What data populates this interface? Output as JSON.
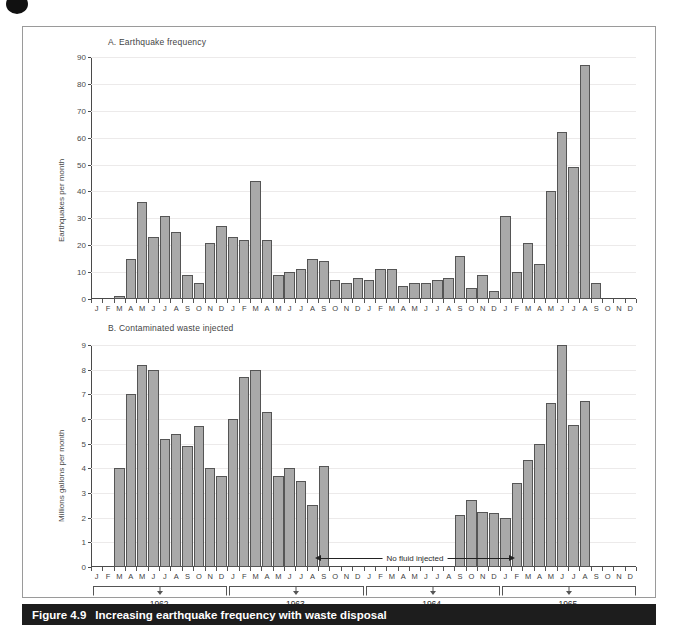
{
  "figure": {
    "caption_number": "Figure 4.9",
    "caption_text": "Increasing earthquake frequency with waste disposal"
  },
  "panel_a": {
    "title": "A. Earthquake frequency"
  },
  "panel_b": {
    "title": "B. Contaminated waste injected",
    "annotation": "No fluid injected"
  },
  "years": [
    {
      "label": "1962",
      "start_index": 0,
      "end_index": 11
    },
    {
      "label": "1963",
      "start_index": 12,
      "end_index": 23
    },
    {
      "label": "1964",
      "start_index": 24,
      "end_index": 35
    },
    {
      "label": "1965",
      "start_index": 36,
      "end_index": 47
    }
  ],
  "months": [
    "J",
    "F",
    "M",
    "A",
    "M",
    "J",
    "J",
    "A",
    "S",
    "O",
    "N",
    "D"
  ],
  "chart_data": [
    {
      "type": "bar",
      "title": "A. Earthquake frequency",
      "xlabel": "",
      "ylabel": "Earthquakes per month",
      "ylim": [
        0,
        90
      ],
      "yticks": [
        0,
        10,
        20,
        30,
        40,
        50,
        60,
        70,
        80,
        90
      ],
      "grid": true,
      "legend": "none",
      "categories": [
        "1962-J",
        "1962-F",
        "1962-M",
        "1962-A",
        "1962-M",
        "1962-J",
        "1962-J",
        "1962-A",
        "1962-S",
        "1962-O",
        "1962-N",
        "1962-D",
        "1963-J",
        "1963-F",
        "1963-M",
        "1963-A",
        "1963-M",
        "1963-J",
        "1963-J",
        "1963-A",
        "1963-S",
        "1963-O",
        "1963-N",
        "1963-D",
        "1964-J",
        "1964-F",
        "1964-M",
        "1964-A",
        "1964-M",
        "1964-J",
        "1964-J",
        "1964-A",
        "1964-S",
        "1964-O",
        "1964-N",
        "1964-D",
        "1965-J",
        "1965-F",
        "1965-M",
        "1965-A",
        "1965-M",
        "1965-J",
        "1965-J",
        "1965-A",
        "1965-S",
        "1965-O",
        "1965-N",
        "1965-D"
      ],
      "values": [
        0,
        0,
        1,
        15,
        36,
        23,
        31,
        25,
        9,
        6,
        21,
        27,
        23,
        22,
        44,
        22,
        9,
        10,
        11,
        15,
        14,
        7,
        6,
        8,
        7,
        11,
        11,
        5,
        6,
        6,
        7,
        8,
        16,
        4,
        9,
        3,
        31,
        10,
        21,
        13,
        40,
        62,
        49,
        87,
        6,
        0,
        0,
        0
      ]
    },
    {
      "type": "bar",
      "title": "B. Contaminated waste injected",
      "xlabel": "",
      "ylabel": "Millions gallons per month",
      "ylim": [
        0,
        9
      ],
      "yticks": [
        0,
        1,
        2,
        3,
        4,
        5,
        6,
        7,
        8,
        9
      ],
      "grid": true,
      "legend": "none",
      "categories": [
        "1962-J",
        "1962-F",
        "1962-M",
        "1962-A",
        "1962-M",
        "1962-J",
        "1962-J",
        "1962-A",
        "1962-S",
        "1962-O",
        "1962-N",
        "1962-D",
        "1963-J",
        "1963-F",
        "1963-M",
        "1963-A",
        "1963-M",
        "1963-J",
        "1963-J",
        "1963-A",
        "1963-S",
        "1963-O",
        "1963-N",
        "1963-D",
        "1964-J",
        "1964-F",
        "1964-M",
        "1964-A",
        "1964-M",
        "1964-J",
        "1964-J",
        "1964-A",
        "1964-S",
        "1964-O",
        "1964-N",
        "1964-D",
        "1965-J",
        "1965-F",
        "1965-M",
        "1965-A",
        "1965-M",
        "1965-J",
        "1965-J",
        "1965-A",
        "1965-S",
        "1965-O",
        "1965-N",
        "1965-D"
      ],
      "values": [
        0,
        0,
        4.0,
        7.0,
        8.2,
        8.0,
        5.2,
        5.4,
        4.9,
        5.7,
        4.0,
        3.7,
        6.0,
        7.7,
        8.0,
        6.3,
        3.7,
        4.0,
        3.5,
        2.5,
        4.1,
        0,
        0,
        0,
        0,
        0,
        0,
        0,
        0,
        0,
        0,
        0,
        2.1,
        2.7,
        2.25,
        2.2,
        2.0,
        3.4,
        4.35,
        5.0,
        6.65,
        9.0,
        5.75,
        6.75,
        0,
        0,
        0,
        0
      ]
    }
  ]
}
